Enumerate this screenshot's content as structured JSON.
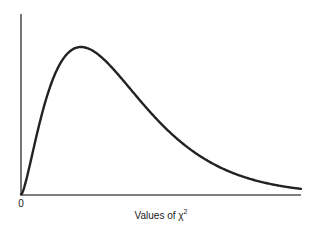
{
  "chart_data": {
    "type": "line",
    "title": "",
    "xlabel": "Values of χ²",
    "xlabel_text": "Values of χ",
    "xlabel_sup": "2",
    "ylabel": "",
    "distribution": "chi-square density",
    "degrees_of_freedom": 5,
    "xlim": [
      0,
      14
    ],
    "ylim": [
      0,
      0.16
    ],
    "x_tick_labels": [
      {
        "value": 0,
        "label": "0"
      }
    ],
    "y_tick_labels": [],
    "grid": false,
    "legend": null,
    "series": [
      {
        "name": "chi-square density",
        "x": [
          0,
          0.5,
          1,
          1.5,
          2,
          2.5,
          3,
          3.5,
          4,
          4.5,
          5,
          5.5,
          6,
          6.5,
          7,
          7.5,
          8,
          8.5,
          9,
          9.5,
          10,
          11,
          12,
          13,
          14
        ],
        "y": [
          0,
          0.0366,
          0.0807,
          0.1144,
          0.1384,
          0.15,
          0.1542,
          0.151,
          0.144,
          0.134,
          0.122,
          0.11,
          0.0973,
          0.0854,
          0.074,
          0.064,
          0.055,
          0.0469,
          0.0399,
          0.0338,
          0.0283,
          0.0197,
          0.0139,
          0.0095,
          0.0064
        ]
      }
    ]
  }
}
